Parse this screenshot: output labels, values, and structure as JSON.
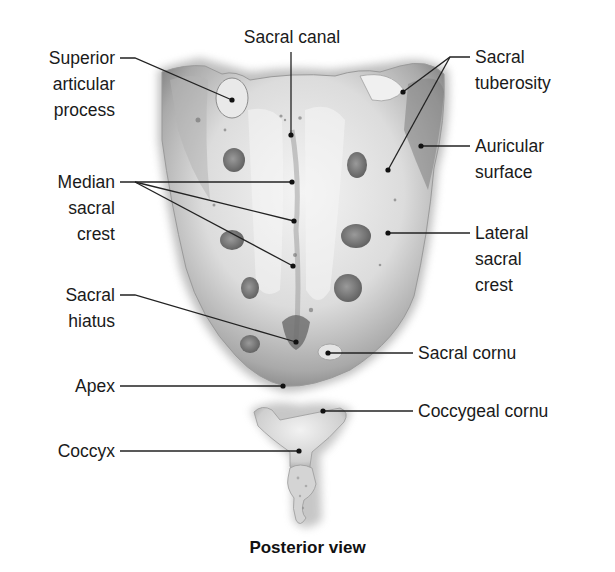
{
  "figure": {
    "caption": "Posterior view"
  },
  "labels": {
    "sacral_canal": "Sacral canal",
    "superior_articular_process": "Superior\narticular\nprocess",
    "sacral_tuberosity": "Sacral\ntuberosity",
    "auricular_surface": "Auricular\nsurface",
    "median_sacral_crest": "Median\nsacral\ncrest",
    "lateral_sacral_crest": "Lateral\nsacral\ncrest",
    "sacral_hiatus": "Sacral\nhiatus",
    "sacral_cornu": "Sacral cornu",
    "apex": "Apex",
    "coccygeal_cornu": "Coccygeal cornu",
    "coccyx": "Coccyx"
  },
  "leaders": [
    {
      "name": "sacral-canal",
      "points": [
        [
          291,
          52
        ],
        [
          291,
          135
        ]
      ]
    },
    {
      "name": "superior-articular-process",
      "points": [
        [
          120,
          58
        ],
        [
          135,
          58
        ],
        [
          232,
          100
        ]
      ]
    },
    {
      "name": "sacral-tuberosity-1",
      "points": [
        [
          470,
          57
        ],
        [
          450,
          57
        ],
        [
          403,
          92
        ]
      ]
    },
    {
      "name": "sacral-tuberosity-2",
      "points": [
        [
          450,
          57
        ],
        [
          388,
          170
        ]
      ]
    },
    {
      "name": "auricular-surface",
      "points": [
        [
          470,
          146
        ],
        [
          421,
          146
        ]
      ]
    },
    {
      "name": "median-sacral-crest-1",
      "points": [
        [
          120,
          182
        ],
        [
          292,
          182
        ]
      ]
    },
    {
      "name": "median-sacral-crest-2",
      "points": [
        [
          135,
          182
        ],
        [
          294,
          221
        ]
      ]
    },
    {
      "name": "median-sacral-crest-3",
      "points": [
        [
          135,
          182
        ],
        [
          293,
          266
        ]
      ]
    },
    {
      "name": "lateral-sacral-crest",
      "points": [
        [
          470,
          233
        ],
        [
          388,
          233
        ]
      ]
    },
    {
      "name": "sacral-hiatus",
      "points": [
        [
          120,
          295
        ],
        [
          135,
          295
        ],
        [
          296,
          342
        ]
      ]
    },
    {
      "name": "sacral-cornu",
      "points": [
        [
          413,
          353
        ],
        [
          328,
          353
        ]
      ]
    },
    {
      "name": "apex",
      "points": [
        [
          120,
          386
        ],
        [
          283,
          386
        ]
      ]
    },
    {
      "name": "coccygeal-cornu",
      "points": [
        [
          413,
          411
        ],
        [
          323,
          411
        ]
      ]
    },
    {
      "name": "coccyx",
      "points": [
        [
          120,
          451
        ],
        [
          299,
          451
        ]
      ]
    }
  ],
  "colors": {
    "background": "#ffffff",
    "text": "#1a1a1a",
    "line": "#222222",
    "bone_light": "#ececec",
    "bone_mid": "#c8c8c8",
    "bone_dark": "#8c8c8c"
  }
}
